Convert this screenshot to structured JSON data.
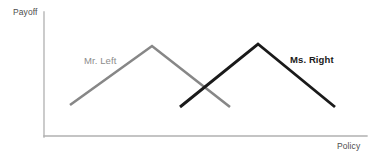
{
  "chart_data": {
    "type": "line",
    "title": "",
    "subtitle": "",
    "xlabel": "Policy",
    "ylabel": "Payoff",
    "xlim": [
      0,
      100
    ],
    "ylim": [
      0,
      100
    ],
    "grid": false,
    "legend_position": "inline-annotation",
    "axes": {
      "x_axis_color": "#b0b0b0",
      "y_axis_color": "#b0b0b0",
      "ticks": [],
      "tick_labels": []
    },
    "annotations": [
      {
        "text": "Payoff",
        "role": "y-axis-label",
        "color": "#4d4d4d"
      },
      {
        "text": "Policy",
        "role": "x-axis-label",
        "color": "#4d4d4d"
      },
      {
        "text": "Mr. Left",
        "role": "series-label",
        "color": "#8c8c8c"
      },
      {
        "text": "Ms. Right",
        "role": "series-label",
        "color": "#1a1a1a"
      }
    ],
    "series": [
      {
        "name": "Mr. Left",
        "color": "#878787",
        "label": "Mr. Left",
        "shape": "tent",
        "peak_x": 34,
        "peak_y": 71,
        "x": [
          8,
          34,
          59
        ],
        "y": [
          25,
          71,
          23
        ]
      },
      {
        "name": "Ms. Right",
        "color": "#1a1a1a",
        "label": "Ms. Right",
        "shape": "tent",
        "peak_x": 66,
        "peak_y": 73,
        "x": [
          42,
          66,
          90
        ],
        "y": [
          23,
          73,
          23
        ]
      }
    ],
    "crossing_point": {
      "x": 50,
      "y": 36
    }
  },
  "geometry": {
    "y_axis": {
      "x": 44,
      "y1": 12,
      "y2": 137
    },
    "x_axis": {
      "y": 136,
      "x1": 44,
      "x2": 367
    },
    "mr_left_points": "70,105 152,46 230,107",
    "ms_right_points": "180,107 258,44 335,107"
  },
  "labels": {
    "payoff": "Payoff",
    "policy": "Policy",
    "mr_left": "Mr. Left",
    "ms_right": "Ms. Right"
  },
  "colors": {
    "mr_left": "#878787",
    "ms_right": "#1a1a1a",
    "axis": "#b0b0b0",
    "axis_text": "#4d4d4d",
    "background": "#ffffff"
  }
}
